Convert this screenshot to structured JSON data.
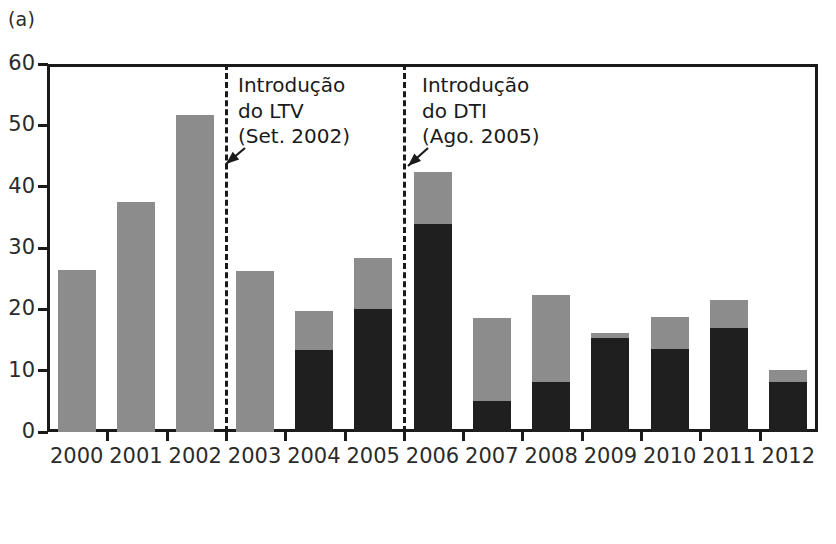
{
  "panels": {
    "a": {
      "label": "(a)"
    },
    "b": {
      "label": "(b)",
      "first_y_tick": "25"
    }
  },
  "chart_data": {
    "type": "bar",
    "subtype": "stacked",
    "title": "",
    "xlabel": "",
    "ylabel": "",
    "ylim": [
      0,
      60
    ],
    "yticks": [
      0,
      10,
      20,
      30,
      40,
      50,
      60
    ],
    "ytick_labels": [
      "0",
      "10",
      "20",
      "30",
      "40",
      "50",
      "60"
    ],
    "grid": false,
    "legend": null,
    "categories": [
      "2000",
      "2001",
      "2002",
      "2003",
      "2004",
      "2005",
      "2006",
      "2007",
      "2008",
      "2009",
      "2010",
      "2011",
      "2012"
    ],
    "series": [
      {
        "name": "black-segment",
        "color": "#201f1f",
        "values": [
          0,
          0,
          0,
          0,
          13.4,
          20.1,
          33.9,
          5.1,
          8.2,
          15.3,
          13.5,
          17.0,
          8.2
        ]
      },
      {
        "name": "gray-segment",
        "color": "#8c8c8c",
        "values": [
          26.4,
          37.5,
          51.7,
          26.3,
          6.3,
          8.3,
          8.5,
          13.5,
          14.2,
          0.9,
          5.3,
          4.5,
          1.9
        ]
      }
    ],
    "totals": [
      26.4,
      37.5,
      51.7,
      26.3,
      19.7,
      28.4,
      42.4,
      18.6,
      22.4,
      16.2,
      18.8,
      21.5,
      10.1
    ],
    "annotations": [
      {
        "id": "ltv",
        "lines": [
          "Introdução",
          "do LTV",
          "(Set. 2002)"
        ],
        "text": "Introdução\ndo LTV\n(Set. 2002)",
        "event_x_category": "2002.5",
        "has_arrow": true
      },
      {
        "id": "dti",
        "lines": [
          "Introdução",
          "do DTI",
          "(Ago. 2005)"
        ],
        "text": "Introdução\ndo DTI\n(Ago. 2005)",
        "event_x_category": "2005.5",
        "has_arrow": true
      }
    ],
    "event_lines": [
      {
        "id": "ltv-line",
        "after_category": "2002",
        "style": "dashed"
      },
      {
        "id": "dti-line",
        "after_category": "2005",
        "style": "dashed"
      }
    ]
  }
}
